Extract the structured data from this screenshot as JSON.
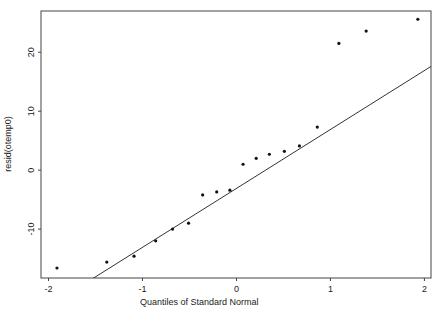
{
  "chart_data": {
    "type": "scatter",
    "title": "",
    "xlabel": "Quantiles of Standard Normal",
    "ylabel": "resid(otemp0)",
    "xlim": [
      -2.08,
      2.07
    ],
    "ylim": [
      -18.3,
      27.0
    ],
    "xticks": [
      -2,
      -1,
      0,
      1,
      2
    ],
    "xtick_labels": [
      "-2",
      "-1",
      "0",
      "1",
      "2"
    ],
    "yticks": [
      -10,
      0,
      10,
      20
    ],
    "ytick_labels": [
      "-10",
      "0",
      "10",
      "20"
    ],
    "grid": false,
    "legend": null,
    "series": [
      {
        "name": "residuals",
        "type": "scatter",
        "x": [
          -1.91,
          -1.38,
          -1.09,
          -0.86,
          -0.68,
          -0.51,
          -0.36,
          -0.21,
          -0.07,
          0.07,
          0.21,
          0.35,
          0.51,
          0.67,
          0.86,
          1.09,
          1.38,
          1.93
        ],
        "y": [
          -16.6,
          -15.6,
          -14.6,
          -12.0,
          -10.0,
          -9.0,
          -4.2,
          -3.7,
          -3.4,
          1.0,
          2.0,
          2.7,
          3.2,
          4.1,
          7.3,
          21.5,
          23.6,
          25.6
        ]
      },
      {
        "name": "reference line",
        "type": "line",
        "slope": 10.0,
        "intercept": -3.1
      }
    ]
  },
  "colors": {
    "points": "#111111",
    "line": "#333333",
    "frame": "#444444",
    "background": "#ffffff"
  }
}
